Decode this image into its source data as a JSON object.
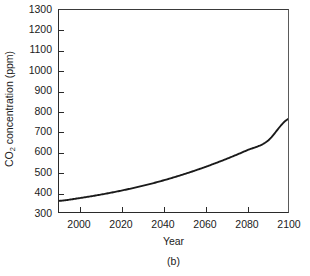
{
  "chart_data": {
    "type": "line",
    "title": "",
    "subtitle": "",
    "caption": "(b)",
    "xlabel": "Year",
    "ylabel_prefix": "CO",
    "ylabel_sub": "2",
    "ylabel_suffix": " concentration (ppm)",
    "ylabel_plain": "CO2 concentration (ppm)",
    "xlim": [
      1990,
      2100
    ],
    "ylim": [
      300,
      1300
    ],
    "grid": false,
    "legend": false,
    "legend_position": "none",
    "xticks": [
      2000,
      2020,
      2040,
      2060,
      2080,
      2100
    ],
    "xtick_labels": [
      "2000",
      "2020",
      "2040",
      "2060",
      "2080",
      "2100"
    ],
    "yticks": [
      300,
      400,
      500,
      600,
      700,
      800,
      900,
      1000,
      1100,
      1200,
      1300
    ],
    "ytick_labels": [
      "300",
      "400",
      "500",
      "600",
      "700",
      "800",
      "900",
      "1000",
      "1100",
      "1200",
      "1300"
    ],
    "series": [
      {
        "name": "CO2 concentration",
        "color": "#1a1a1a",
        "line_width": 1.9,
        "x": [
          1990,
          2000,
          2010,
          2020,
          2030,
          2040,
          2050,
          2060,
          2070,
          2080,
          2090,
          2100
        ],
        "values": [
          355,
          369,
          386,
          406,
          429,
          456,
          487,
          522,
          561,
          604,
          650,
          760
        ]
      }
    ]
  }
}
